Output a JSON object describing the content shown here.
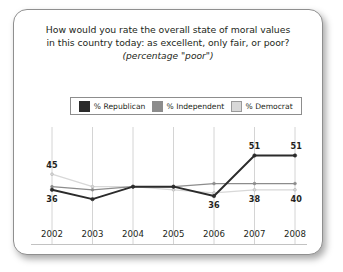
{
  "card": {
    "background": "#ffffff",
    "border_color": "#8f8f8f"
  },
  "title": {
    "line1": "How would you rate the overall state of moral values",
    "line2": "in this country today: as excellent, only fair, or poor?",
    "subtitle": "(percentage \"poor\")"
  },
  "legend": {
    "position": "top",
    "items": [
      {
        "label": "% Republican",
        "color": "#2b2b2b"
      },
      {
        "label": "% Independent",
        "color": "#8c8c8c"
      },
      {
        "label": "% Democrat",
        "color": "#d8d8d8"
      }
    ]
  },
  "chart_data": {
    "type": "line",
    "title": "How would you rate the overall state of moral values in this country today: as excellent, only fair, or poor?",
    "subtitle": "(percentage \"poor\")",
    "xlabel": "",
    "ylabel": "",
    "ylim": [
      30,
      55
    ],
    "grid": "vertical",
    "legend_position": "top",
    "categories": [
      "2002",
      "2003",
      "2004",
      "2005",
      "2006",
      "2007",
      "2008"
    ],
    "series": [
      {
        "name": "% Republican",
        "color": "#2b2b2b",
        "values": [
          40,
          37,
          41,
          41,
          38,
          51,
          51
        ]
      },
      {
        "name": "% Independent",
        "color": "#8c8c8c",
        "values": [
          41,
          40,
          41,
          41,
          42,
          42,
          42
        ]
      },
      {
        "name": "% Democrat",
        "color": "#d8d8d8",
        "values": [
          45,
          41,
          41,
          40,
          39,
          40,
          40
        ]
      }
    ],
    "point_labels": [
      {
        "series": "% Democrat",
        "category": "2002",
        "value": 45,
        "text": "45",
        "placement": "above"
      },
      {
        "series": "% Republican",
        "category": "2002",
        "value": 40,
        "text": "36",
        "placement": "below"
      },
      {
        "series": "% Republican",
        "category": "2006",
        "value": 38,
        "text": "36",
        "placement": "below"
      },
      {
        "series": "% Republican",
        "category": "2007",
        "value": 51,
        "text": "51",
        "placement": "above"
      },
      {
        "series": "% Republican",
        "category": "2008",
        "value": 51,
        "text": "51",
        "placement": "above"
      },
      {
        "series": "% Democrat",
        "category": "2007",
        "value": 40,
        "text": "38",
        "placement": "below"
      },
      {
        "series": "% Democrat",
        "category": "2008",
        "value": 40,
        "text": "40",
        "placement": "below"
      }
    ]
  },
  "x_axis": {
    "ticks": [
      "2002",
      "2003",
      "2004",
      "2005",
      "2006",
      "2007",
      "2008"
    ]
  }
}
